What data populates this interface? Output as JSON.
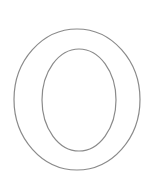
{
  "glyph": {
    "character": "O",
    "style": "outline",
    "stroke_color": "#8a8a8a",
    "fill_color": "#ffffff",
    "stroke_width": 1.2,
    "outer": {
      "cx": 77,
      "cy": 99.5,
      "rx": 63,
      "ry": 70.5
    },
    "inner": {
      "cx": 79,
      "cy": 100,
      "rx": 37,
      "ry": 51
    }
  }
}
